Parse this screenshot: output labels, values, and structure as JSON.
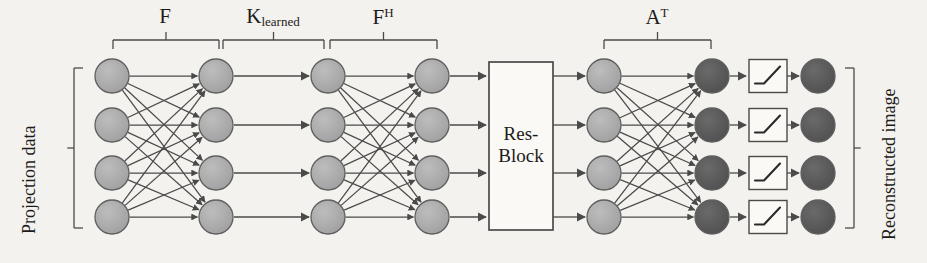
{
  "figure": {
    "type": "neural-network-architecture-diagram",
    "background_color": "#f4f2ee",
    "ink_color": "#4a4a4a",
    "node_color_light": "#a8a8a8",
    "node_color_dark": "#585858",
    "width": 927,
    "height": 263
  },
  "side_labels": {
    "left": "Projection data",
    "right": "Reconstructed image"
  },
  "stage_labels": [
    {
      "id": "F",
      "text": "F",
      "sub": "",
      "sup": "",
      "x_center": 165,
      "brace_left": 113,
      "brace_right": 219
    },
    {
      "id": "K_learned",
      "text": "K",
      "sub": "learned",
      "sup": "",
      "x_center": 273,
      "brace_left": 223,
      "brace_right": 324
    },
    {
      "id": "FH",
      "text": "F",
      "sub": "",
      "sup": "H",
      "x_center": 383,
      "brace_left": 330,
      "brace_right": 437
    },
    {
      "id": "AT",
      "text": "A",
      "sub": "",
      "sup": "T",
      "x_center": 657,
      "brace_left": 604,
      "brace_right": 711
    }
  ],
  "block": {
    "name": "Res-Block",
    "line1": "Res-",
    "line2": "Block",
    "x": 489,
    "y": 62,
    "width": 64,
    "height": 168
  },
  "node_rows_y": [
    76,
    125,
    173,
    217
  ],
  "node_columns": [
    {
      "id": "col1",
      "name": "input-layer",
      "x": 112,
      "r": 17,
      "shade": "light"
    },
    {
      "id": "col2",
      "name": "fourier-layer",
      "x": 216,
      "r": 17,
      "shade": "light"
    },
    {
      "id": "col3",
      "name": "filtered-layer",
      "x": 328,
      "r": 17,
      "shade": "light"
    },
    {
      "id": "col4",
      "name": "inverse-fourier-layer",
      "x": 432,
      "r": 17,
      "shade": "light"
    },
    {
      "id": "col5",
      "name": "resblock-output-layer",
      "x": 604,
      "r": 17,
      "shade": "light"
    },
    {
      "id": "col6",
      "name": "backprojection-layer",
      "x": 712,
      "r": 17,
      "shade": "dark"
    },
    {
      "id": "col7",
      "name": "output-layer",
      "x": 818,
      "r": 17,
      "shade": "dark"
    }
  ],
  "connections": [
    {
      "from": "col1",
      "to": "col2",
      "pattern": "fully-connected"
    },
    {
      "from": "col2",
      "to": "col3",
      "pattern": "one-to-one"
    },
    {
      "from": "col3",
      "to": "col4",
      "pattern": "fully-connected"
    },
    {
      "from": "col4",
      "to": "block",
      "pattern": "one-to-one"
    },
    {
      "from": "block",
      "to": "col5",
      "pattern": "one-to-one"
    },
    {
      "from": "col5",
      "to": "col6",
      "pattern": "fully-connected"
    },
    {
      "from": "col6",
      "to": "activation",
      "pattern": "one-to-one"
    },
    {
      "from": "activation",
      "to": "col7",
      "pattern": "one-to-one"
    }
  ],
  "activation_boxes": {
    "name": "relu-activation",
    "count": 4,
    "x": 749,
    "width": 38,
    "height": 33,
    "glyph": "relu-curve"
  },
  "side_braces": {
    "left": {
      "x": 74,
      "top": 68,
      "bottom": 228
    },
    "right": {
      "x": 854,
      "top": 68,
      "bottom": 228
    }
  }
}
